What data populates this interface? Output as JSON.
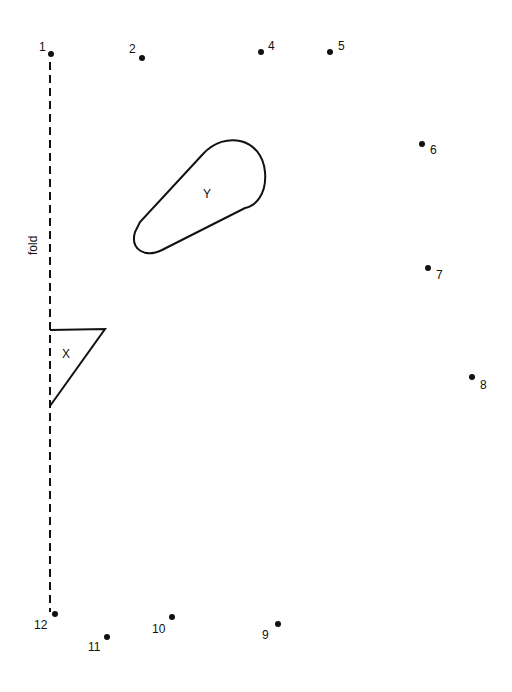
{
  "diagram": {
    "fold_label": "fold",
    "shape_labels": {
      "x": "X",
      "y": "Y"
    },
    "points": [
      {
        "label": "1",
        "x": 51,
        "y": 54
      },
      {
        "label": "2",
        "x": 142,
        "y": 58
      },
      {
        "label": "4",
        "x": 261,
        "y": 52
      },
      {
        "label": "5",
        "x": 330,
        "y": 52
      },
      {
        "label": "6",
        "x": 422,
        "y": 144
      },
      {
        "label": "7",
        "x": 428,
        "y": 268
      },
      {
        "label": "8",
        "x": 472,
        "y": 377
      },
      {
        "label": "9",
        "x": 278,
        "y": 624
      },
      {
        "label": "10",
        "x": 172,
        "y": 617
      },
      {
        "label": "11",
        "x": 107,
        "y": 637
      },
      {
        "label": "12",
        "x": 55,
        "y": 614
      }
    ]
  }
}
